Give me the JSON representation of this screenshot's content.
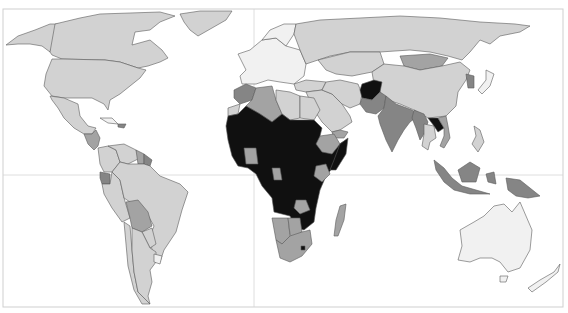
{
  "map": {
    "type": "choropleth",
    "projection": "world",
    "colors": {
      "very_low": "#f1f1f1",
      "low": "#d2d2d2",
      "medium": "#a3a3a3",
      "high": "#858585",
      "very_high": "#101010",
      "water": "#ffffff",
      "frame": "#cfcfcf",
      "grid": "#d6d6d6",
      "border": "#5a5a5a"
    },
    "graticule": {
      "equator_y": 175,
      "prime_meridian_x": 254
    },
    "regions": [
      {
        "name": "Alaska",
        "class": "low"
      },
      {
        "name": "Canada",
        "class": "low"
      },
      {
        "name": "Greenland",
        "class": "low"
      },
      {
        "name": "United States",
        "class": "low"
      },
      {
        "name": "Mexico",
        "class": "low"
      },
      {
        "name": "Central America",
        "class": "medium"
      },
      {
        "name": "Cuba",
        "class": "very_low"
      },
      {
        "name": "Haiti",
        "class": "high"
      },
      {
        "name": "Colombia",
        "class": "low"
      },
      {
        "name": "Venezuela",
        "class": "low"
      },
      {
        "name": "Guyana",
        "class": "medium"
      },
      {
        "name": "Suriname",
        "class": "high"
      },
      {
        "name": "Ecuador",
        "class": "high"
      },
      {
        "name": "Peru",
        "class": "low"
      },
      {
        "name": "Brazil",
        "class": "low"
      },
      {
        "name": "Bolivia",
        "class": "medium"
      },
      {
        "name": "Paraguay",
        "class": "low"
      },
      {
        "name": "Chile",
        "class": "low"
      },
      {
        "name": "Argentina",
        "class": "low"
      },
      {
        "name": "Uruguay",
        "class": "very_low"
      },
      {
        "name": "Europe",
        "class": "very_low"
      },
      {
        "name": "Scandinavia",
        "class": "very_low"
      },
      {
        "name": "Russia",
        "class": "low"
      },
      {
        "name": "Kazakhstan",
        "class": "low"
      },
      {
        "name": "Mongolia",
        "class": "medium"
      },
      {
        "name": "China",
        "class": "low"
      },
      {
        "name": "Korea",
        "class": "high"
      },
      {
        "name": "Japan",
        "class": "very_low"
      },
      {
        "name": "Turkey",
        "class": "low"
      },
      {
        "name": "Middle East",
        "class": "low"
      },
      {
        "name": "Yemen",
        "class": "medium"
      },
      {
        "name": "Iran",
        "class": "low"
      },
      {
        "name": "Afghanistan",
        "class": "very_high"
      },
      {
        "name": "Pakistan",
        "class": "high"
      },
      {
        "name": "India",
        "class": "high"
      },
      {
        "name": "Myanmar",
        "class": "high"
      },
      {
        "name": "Thailand",
        "class": "low"
      },
      {
        "name": "Laos",
        "class": "very_high"
      },
      {
        "name": "Vietnam",
        "class": "medium"
      },
      {
        "name": "Philippines",
        "class": "low"
      },
      {
        "name": "Indonesia",
        "class": "high"
      },
      {
        "name": "Papua New Guinea",
        "class": "high"
      },
      {
        "name": "Australia",
        "class": "very_low"
      },
      {
        "name": "New Zealand",
        "class": "very_low"
      },
      {
        "name": "Morocco",
        "class": "high"
      },
      {
        "name": "Algeria",
        "class": "medium"
      },
      {
        "name": "Libya",
        "class": "low"
      },
      {
        "name": "Egypt",
        "class": "low"
      },
      {
        "name": "Western Sahara",
        "class": "low"
      },
      {
        "name": "Sub-Saharan Africa",
        "class": "very_high"
      },
      {
        "name": "Ghana / Ivory Coast",
        "class": "medium"
      },
      {
        "name": "Ethiopia",
        "class": "medium"
      },
      {
        "name": "Somalia",
        "class": "very_high"
      },
      {
        "name": "Kenya",
        "class": "medium"
      },
      {
        "name": "Gabon",
        "class": "medium"
      },
      {
        "name": "Namibia",
        "class": "medium"
      },
      {
        "name": "Botswana",
        "class": "medium"
      },
      {
        "name": "South Africa",
        "class": "medium"
      },
      {
        "name": "Lesotho",
        "class": "very_high"
      },
      {
        "name": "Zimbabwe",
        "class": "medium"
      },
      {
        "name": "Madagascar",
        "class": "medium"
      }
    ]
  }
}
